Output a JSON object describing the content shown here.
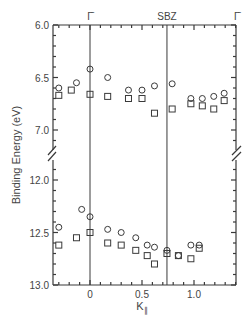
{
  "chart_data": {
    "type": "scatter",
    "title": "",
    "xlabel": "K∥",
    "ylabel": "Binding Energy (eV)",
    "xlim": [
      -0.35,
      1.41
    ],
    "ylim_upper_panel": [
      6.0,
      7.2
    ],
    "ylim_lower_panel": [
      11.9,
      13.0
    ],
    "y_axis_break": true,
    "y_inverted": true,
    "x_ticks": [
      0,
      0.5,
      1.0
    ],
    "x_tick_labels": [
      "0",
      "0.5",
      "1.0"
    ],
    "y_ticks_upper": [
      6.0,
      6.5,
      7.0
    ],
    "y_tick_labels_upper": [
      "6.0",
      "6.5",
      "7.0"
    ],
    "y_ticks_lower": [
      12.0,
      12.5,
      13.0
    ],
    "y_tick_labels_lower": [
      "12.0",
      "12.5",
      "13.0"
    ],
    "top_labels": [
      {
        "text": "Γ̄",
        "x": 0.0
      },
      {
        "text": "SBZ",
        "x": 0.74
      },
      {
        "text": "Γ̄",
        "x": 1.41
      }
    ],
    "vertical_lines": [
      0.0,
      0.74
    ],
    "grid": false,
    "legend": null,
    "series": [
      {
        "name": "circles-upper",
        "marker": "circle",
        "x": [
          -0.3,
          -0.13,
          0.0,
          0.17,
          0.37,
          0.5,
          0.62,
          0.79,
          0.97,
          1.08,
          1.19,
          1.29
        ],
        "y": [
          6.6,
          6.55,
          6.42,
          6.5,
          6.62,
          6.62,
          6.58,
          6.56,
          6.7,
          6.7,
          6.68,
          6.65
        ]
      },
      {
        "name": "squares-upper",
        "marker": "square",
        "x": [
          -0.3,
          -0.18,
          0.0,
          0.17,
          0.37,
          0.5,
          0.62,
          0.79,
          0.97,
          1.08,
          1.19,
          1.29
        ],
        "y": [
          6.67,
          6.62,
          6.66,
          6.68,
          6.7,
          6.7,
          6.84,
          6.8,
          6.75,
          6.77,
          6.8,
          6.72
        ]
      },
      {
        "name": "circles-lower",
        "marker": "circle",
        "x": [
          -0.3,
          -0.08,
          0.0,
          0.17,
          0.3,
          0.44,
          0.55,
          0.62,
          0.74,
          0.85,
          0.97,
          1.05
        ],
        "y": [
          12.45,
          12.28,
          12.35,
          12.47,
          12.5,
          12.55,
          12.62,
          12.64,
          12.67,
          12.72,
          12.62,
          12.62
        ]
      },
      {
        "name": "squares-lower",
        "marker": "square",
        "x": [
          -0.3,
          -0.13,
          0.0,
          0.17,
          0.3,
          0.44,
          0.55,
          0.62,
          0.74,
          0.85,
          0.97,
          1.05
        ],
        "y": [
          12.62,
          12.55,
          12.5,
          12.6,
          12.62,
          12.67,
          12.72,
          12.8,
          12.7,
          12.72,
          12.75,
          12.65
        ]
      }
    ]
  },
  "colors": {
    "ink": "#3a3a3a",
    "background": "#ffffff"
  }
}
